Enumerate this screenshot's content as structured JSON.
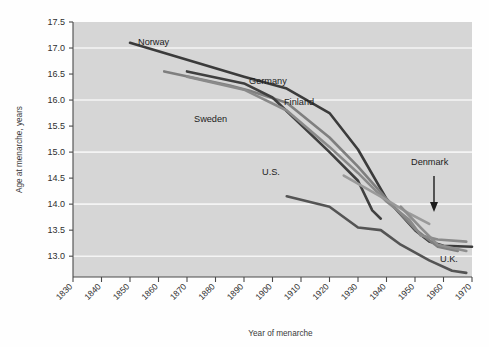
{
  "chart_data": {
    "type": "line",
    "title": "",
    "xlabel": "Year of menarche",
    "ylabel": "Age at menarche, years",
    "xlim": [
      1830,
      1970
    ],
    "ylim": [
      12.6,
      17.5
    ],
    "grid": true,
    "grid_values": [
      17.0,
      16.0,
      15.0,
      14.0,
      13.0
    ],
    "legend_position": "inline-labels",
    "xticks": [
      "1830",
      "1840",
      "1850",
      "1860",
      "1870",
      "1880",
      "1890",
      "1900",
      "1910",
      "1920",
      "1930",
      "1940",
      "1950",
      "1960",
      "1970"
    ],
    "yticks": [
      "17.5",
      "17.0",
      "16.5",
      "16.0",
      "15.5",
      "15.0",
      "14.5",
      "14.0",
      "13.5",
      "13.0"
    ],
    "series": [
      {
        "name": "Norway",
        "color": "#3b3b3b",
        "label": "Norway",
        "points": [
          [
            1850,
            17.1
          ],
          [
            1890,
            16.45
          ],
          [
            1905,
            16.22
          ],
          [
            1920,
            15.75
          ],
          [
            1930,
            15.05
          ],
          [
            1940,
            14.1
          ],
          [
            1950,
            13.5
          ],
          [
            1955,
            13.28
          ],
          [
            1960,
            13.2
          ],
          [
            1970,
            13.18
          ]
        ]
      },
      {
        "name": "Sweden",
        "color": "#7f7f7f",
        "label": "Sweden",
        "points": [
          [
            1862,
            16.55
          ],
          [
            1885,
            16.28
          ],
          [
            1892,
            16.18
          ],
          [
            1905,
            15.95
          ],
          [
            1920,
            15.28
          ],
          [
            1930,
            14.72
          ],
          [
            1940,
            14.1
          ],
          [
            1950,
            13.52
          ],
          [
            1958,
            13.18
          ],
          [
            1965,
            13.1
          ]
        ]
      },
      {
        "name": "Germany",
        "color": "#3f3f3f",
        "label": "Germany",
        "points": [
          [
            1870,
            16.55
          ],
          [
            1890,
            16.32
          ],
          [
            1900,
            16.05
          ],
          [
            1920,
            15.0
          ],
          [
            1930,
            14.45
          ],
          [
            1935,
            13.88
          ],
          [
            1938,
            13.72
          ]
        ]
      },
      {
        "name": "Finland",
        "color": "#8a8a8a",
        "label": "Finland",
        "points": [
          [
            1870,
            16.45
          ],
          [
            1890,
            16.2
          ],
          [
            1905,
            15.8
          ],
          [
            1920,
            15.1
          ],
          [
            1930,
            14.6
          ],
          [
            1940,
            14.05
          ],
          [
            1948,
            13.7
          ],
          [
            1952,
            13.4
          ],
          [
            1958,
            13.32
          ],
          [
            1968,
            13.28
          ]
        ]
      },
      {
        "name": "U.S.",
        "color": "#545454",
        "label": "U.S.",
        "points": [
          [
            1905,
            14.15
          ],
          [
            1920,
            13.95
          ],
          [
            1930,
            13.55
          ],
          [
            1938,
            13.5
          ],
          [
            1945,
            13.22
          ],
          [
            1955,
            12.92
          ],
          [
            1963,
            12.72
          ],
          [
            1968,
            12.68
          ]
        ]
      },
      {
        "name": "Denmark",
        "color": "#9a9a9a",
        "label": "Denmark",
        "points": [
          [
            1925,
            14.55
          ],
          [
            1940,
            14.08
          ],
          [
            1948,
            13.82
          ],
          [
            1955,
            13.62
          ]
        ]
      },
      {
        "name": "U.K.",
        "color": "#8e8e8e",
        "label": "U.K.",
        "points": [
          [
            1945,
            13.95
          ],
          [
            1952,
            13.55
          ],
          [
            1958,
            13.22
          ],
          [
            1968,
            13.1
          ]
        ]
      }
    ],
    "annotations": [
      {
        "name": "denmark-pointer",
        "text": "Denmark",
        "points_to": [
          1955,
          13.7
        ]
      }
    ]
  },
  "style": {
    "plot_background": "#d6d6d6",
    "page_background": "#fefefe",
    "grid_color": "#f4f4f4",
    "axis_color": "#4a4a4a",
    "text_color": "#2e2e2e"
  }
}
